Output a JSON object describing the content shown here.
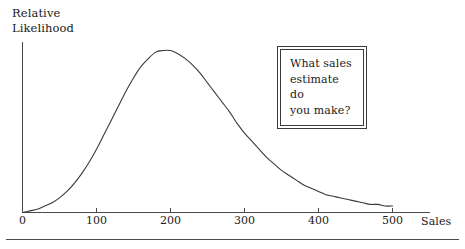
{
  "figure": {
    "y_axis_title": "Relative\nLikelihood",
    "x_axis_title": "Sales",
    "callout": "What sales\nestimate do\nyou make?"
  },
  "chart_data": {
    "type": "line",
    "title": "",
    "subtitle": "",
    "xlabel": "Sales",
    "ylabel": "Relative Likelihood",
    "xlim": [
      0,
      550
    ],
    "ylim": [
      0,
      1.08
    ],
    "grid": false,
    "legend": null,
    "xticks": [
      0,
      100,
      200,
      300,
      400,
      500
    ],
    "xtick_labels": [
      "0",
      "100",
      "200",
      "300",
      "400",
      "500"
    ],
    "yticks": [],
    "ytick_labels": [],
    "annotations": [
      {
        "text": "What sales\nestimate do\nyou make?",
        "x": 350,
        "y": 0.82,
        "style": "double-border-box"
      }
    ],
    "series": [
      {
        "name": "relative likelihood",
        "color": "#3a3a3a",
        "x": [
          0,
          10,
          20,
          30,
          40,
          50,
          60,
          70,
          80,
          90,
          100,
          110,
          120,
          130,
          140,
          150,
          160,
          170,
          180,
          190,
          200,
          210,
          220,
          230,
          240,
          250,
          260,
          270,
          280,
          290,
          300,
          310,
          320,
          330,
          340,
          350,
          360,
          370,
          380,
          390,
          400,
          410,
          420,
          430,
          440,
          450,
          460,
          470,
          480,
          490,
          500
        ],
        "y": [
          0.0,
          0.01,
          0.02,
          0.04,
          0.06,
          0.09,
          0.13,
          0.18,
          0.24,
          0.31,
          0.39,
          0.48,
          0.57,
          0.66,
          0.75,
          0.83,
          0.9,
          0.95,
          0.99,
          1.0,
          1.0,
          0.98,
          0.95,
          0.91,
          0.86,
          0.8,
          0.74,
          0.68,
          0.62,
          0.55,
          0.49,
          0.44,
          0.39,
          0.34,
          0.3,
          0.26,
          0.23,
          0.2,
          0.17,
          0.15,
          0.13,
          0.11,
          0.1,
          0.09,
          0.08,
          0.07,
          0.06,
          0.05,
          0.05,
          0.04,
          0.04
        ]
      }
    ]
  }
}
